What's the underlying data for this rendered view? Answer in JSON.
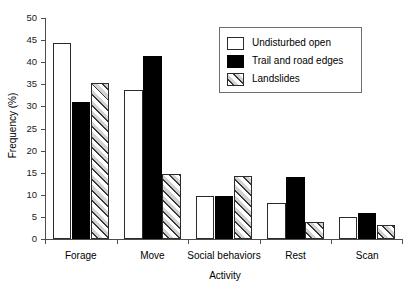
{
  "chart_data": {
    "type": "bar",
    "title": "",
    "xlabel": "Activity",
    "ylabel": "Frequency (%)",
    "categories": [
      "Forage",
      "Move",
      "Social behaviors",
      "Rest",
      "Scan"
    ],
    "series": [
      {
        "name": "Undisturbed open",
        "values": [
          44.3,
          33.8,
          9.8,
          8.2,
          4.9
        ]
      },
      {
        "name": "Trail and road edges",
        "values": [
          31.0,
          41.5,
          9.8,
          14.0,
          5.8
        ]
      },
      {
        "name": "Landslides",
        "values": [
          35.2,
          14.7,
          14.2,
          3.9,
          3.2
        ]
      }
    ],
    "ylim": [
      0,
      50
    ],
    "yticks": [
      0,
      5,
      10,
      15,
      20,
      25,
      30,
      35,
      40,
      45,
      50
    ],
    "ytick_labels": [
      "0",
      "5",
      "10",
      "15",
      "20",
      "25",
      "30",
      "35",
      "40",
      "45",
      "50"
    ],
    "grid": false,
    "legend_position": "top-right",
    "colors": {
      "series_0": "#ffffff",
      "series_1": "#000000",
      "series_2": "#d2d2d2",
      "outline": "#2b2b2b",
      "axis": "#4d4d4d",
      "background": "#ffffff"
    }
  },
  "legend": {
    "entries": [
      {
        "label": "Undisturbed open"
      },
      {
        "label": "Trail and road edges"
      },
      {
        "label": "Landslides"
      }
    ]
  }
}
